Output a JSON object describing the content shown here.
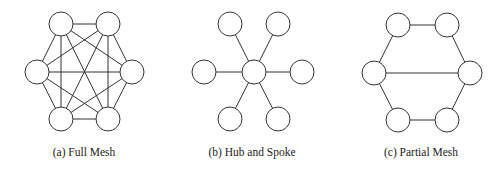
{
  "diagrams": [
    {
      "id": "full-mesh",
      "caption": "(a) Full Mesh",
      "caption_x": 84,
      "node_radius": 12,
      "nodes": [
        {
          "name": "top-left",
          "x": 61,
          "y": 24
        },
        {
          "name": "top-right",
          "x": 108,
          "y": 24
        },
        {
          "name": "left",
          "x": 37,
          "y": 72
        },
        {
          "name": "right",
          "x": 132,
          "y": 72
        },
        {
          "name": "bottom-left",
          "x": 61,
          "y": 119
        },
        {
          "name": "bottom-right",
          "x": 108,
          "y": 119
        }
      ],
      "edges": [
        [
          0,
          1
        ],
        [
          0,
          2
        ],
        [
          0,
          3
        ],
        [
          0,
          4
        ],
        [
          0,
          5
        ],
        [
          1,
          2
        ],
        [
          1,
          3
        ],
        [
          1,
          4
        ],
        [
          1,
          5
        ],
        [
          2,
          3
        ],
        [
          2,
          4
        ],
        [
          2,
          5
        ],
        [
          3,
          4
        ],
        [
          3,
          5
        ],
        [
          4,
          5
        ]
      ]
    },
    {
      "id": "hub-and-spoke",
      "caption": "(b) Hub and Spoke",
      "caption_x": 252,
      "node_radius": 12,
      "nodes": [
        {
          "name": "hub",
          "x": 254,
          "y": 72
        },
        {
          "name": "top-left",
          "x": 230,
          "y": 24
        },
        {
          "name": "top-right",
          "x": 278,
          "y": 24
        },
        {
          "name": "left",
          "x": 204,
          "y": 72
        },
        {
          "name": "right",
          "x": 302,
          "y": 72
        },
        {
          "name": "bottom-left",
          "x": 230,
          "y": 119
        },
        {
          "name": "bottom-right",
          "x": 278,
          "y": 119
        }
      ],
      "edges": [
        [
          0,
          1
        ],
        [
          0,
          2
        ],
        [
          0,
          3
        ],
        [
          0,
          4
        ],
        [
          0,
          5
        ],
        [
          0,
          6
        ]
      ]
    },
    {
      "id": "partial-mesh",
      "caption": "(c) Partial Mesh",
      "caption_x": 421,
      "node_radius": 12,
      "nodes": [
        {
          "name": "top-left",
          "x": 398,
          "y": 25
        },
        {
          "name": "top-right",
          "x": 447,
          "y": 25
        },
        {
          "name": "left",
          "x": 374,
          "y": 73
        },
        {
          "name": "right",
          "x": 470,
          "y": 73
        },
        {
          "name": "bottom-left",
          "x": 398,
          "y": 120
        },
        {
          "name": "bottom-right",
          "x": 447,
          "y": 120
        }
      ],
      "edges": [
        [
          0,
          1
        ],
        [
          0,
          2
        ],
        [
          1,
          3
        ],
        [
          2,
          3
        ],
        [
          2,
          4
        ],
        [
          3,
          5
        ],
        [
          4,
          5
        ]
      ]
    }
  ],
  "colors": {
    "stroke": "#333333",
    "fill": "#ffffff",
    "text": "#222222"
  }
}
